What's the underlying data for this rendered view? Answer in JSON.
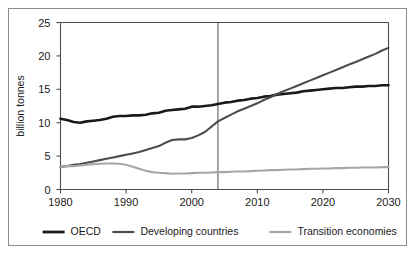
{
  "chart_data": {
    "type": "line",
    "title": "",
    "subtitle": "",
    "xlabel": "",
    "ylabel": "billion tonnes",
    "xlim": [
      1980,
      2030
    ],
    "ylim": [
      0,
      25
    ],
    "xticks": [
      1980,
      1990,
      2000,
      2010,
      2020,
      2030
    ],
    "yticks": [
      0,
      5,
      10,
      15,
      20,
      25
    ],
    "xtick_labels": [
      "1980",
      "1990",
      "2000",
      "2010",
      "2020",
      "2030"
    ],
    "ytick_labels": [
      "0",
      "5",
      "10",
      "15",
      "20",
      "25"
    ],
    "grid": false,
    "legend_position": "bottom",
    "annotations": [
      {
        "type": "vertical-line",
        "x": 2004,
        "label": "",
        "note": "divider separating historical data from projection"
      }
    ],
    "x": [
      1980,
      1981,
      1982,
      1983,
      1984,
      1985,
      1986,
      1987,
      1988,
      1989,
      1990,
      1991,
      1992,
      1993,
      1994,
      1995,
      1996,
      1997,
      1998,
      1999,
      2000,
      2001,
      2002,
      2003,
      2004,
      2005,
      2006,
      2007,
      2008,
      2009,
      2010,
      2011,
      2012,
      2013,
      2014,
      2015,
      2016,
      2017,
      2018,
      2019,
      2020,
      2021,
      2022,
      2023,
      2024,
      2025,
      2026,
      2027,
      2028,
      2029,
      2030
    ],
    "series": [
      {
        "name": "OECD",
        "color": "#1a1a1a",
        "width": 2.6,
        "values": [
          10.6,
          10.4,
          10.1,
          10.0,
          10.2,
          10.3,
          10.4,
          10.6,
          10.9,
          11.0,
          11.0,
          11.1,
          11.1,
          11.2,
          11.4,
          11.5,
          11.8,
          11.9,
          12.0,
          12.1,
          12.4,
          12.4,
          12.5,
          12.6,
          12.8,
          13.0,
          13.1,
          13.3,
          13.4,
          13.6,
          13.7,
          13.9,
          14.0,
          14.2,
          14.3,
          14.4,
          14.5,
          14.7,
          14.8,
          14.9,
          15.0,
          15.1,
          15.2,
          15.2,
          15.3,
          15.4,
          15.4,
          15.5,
          15.5,
          15.6,
          15.6
        ]
      },
      {
        "name": "Developing countries",
        "color": "#4d4d4d",
        "width": 2.1,
        "values": [
          3.4,
          3.5,
          3.7,
          3.8,
          4.0,
          4.2,
          4.4,
          4.6,
          4.8,
          5.0,
          5.2,
          5.4,
          5.6,
          5.9,
          6.2,
          6.5,
          7.0,
          7.4,
          7.5,
          7.5,
          7.7,
          8.1,
          8.6,
          9.4,
          10.2,
          10.7,
          11.2,
          11.7,
          12.1,
          12.5,
          12.9,
          13.4,
          13.8,
          14.3,
          14.7,
          15.1,
          15.5,
          15.9,
          16.3,
          16.7,
          17.1,
          17.5,
          17.9,
          18.3,
          18.7,
          19.1,
          19.5,
          19.9,
          20.3,
          20.8,
          21.2
        ]
      },
      {
        "name": "Transition economies",
        "color": "#a6a6a6",
        "width": 2.1,
        "values": [
          3.4,
          3.5,
          3.5,
          3.6,
          3.7,
          3.8,
          3.85,
          3.9,
          3.9,
          3.85,
          3.7,
          3.4,
          3.1,
          2.8,
          2.6,
          2.5,
          2.45,
          2.35,
          2.4,
          2.4,
          2.45,
          2.5,
          2.5,
          2.55,
          2.6,
          2.6,
          2.65,
          2.7,
          2.7,
          2.75,
          2.8,
          2.85,
          2.9,
          2.9,
          2.95,
          3.0,
          3.0,
          3.05,
          3.1,
          3.1,
          3.15,
          3.15,
          3.2,
          3.2,
          3.25,
          3.25,
          3.3,
          3.3,
          3.3,
          3.35,
          3.35
        ]
      }
    ],
    "legend": [
      {
        "label": "OECD",
        "color": "#1a1a1a",
        "width": 2.8
      },
      {
        "label": "Developing countries",
        "color": "#4d4d4d",
        "width": 2.2
      },
      {
        "label": "Transition economies",
        "color": "#a6a6a6",
        "width": 2.2
      }
    ]
  }
}
